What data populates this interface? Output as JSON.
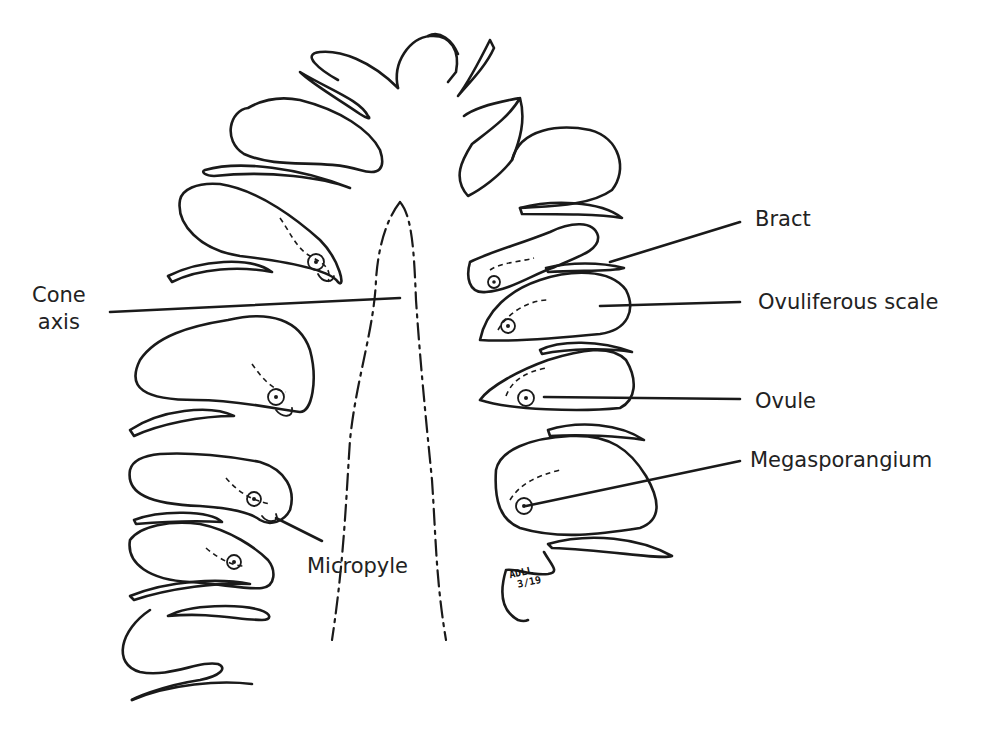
{
  "diagram": {
    "labels": {
      "cone_axis_line1": "Cone",
      "cone_axis_line2": "axis",
      "bract": "Bract",
      "ovuliferous_scale": "Ovuliferous scale",
      "ovule": "Ovule",
      "megasporangium": "Megasporangium",
      "micropyle": "Micropyle"
    },
    "signature": {
      "initials": "ADLL",
      "date": "3/19"
    },
    "colors": {
      "line": "#1a1a1a",
      "text": "#222222",
      "background": "#ffffff"
    }
  }
}
